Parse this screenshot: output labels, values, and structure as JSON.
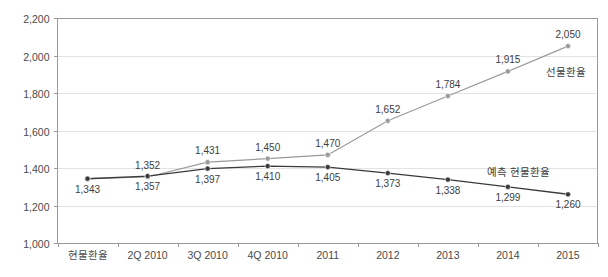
{
  "chart_data": {
    "type": "line",
    "title": "",
    "title_note": "title is cropped off the top edge of the screenshot and is not legible",
    "xlabel": "",
    "ylabel": "",
    "categories": [
      "현물환율",
      "2Q 2010",
      "3Q 2010",
      "4Q 2010",
      "2011",
      "2012",
      "2013",
      "2014",
      "2015"
    ],
    "ylim": [
      1000,
      2200
    ],
    "yticks": [
      1000,
      1200,
      1400,
      1600,
      1800,
      2000,
      2200
    ],
    "ytick_labels": [
      "1,000",
      "1,200",
      "1,400",
      "1,600",
      "1,800",
      "2,000",
      "2,200"
    ],
    "grid": true,
    "legend_position": "inline-end-of-line",
    "series": [
      {
        "name": "선물환율",
        "color": "#9a9a9a",
        "marker": "circle",
        "values": [
          1343,
          1352,
          1431,
          1450,
          1470,
          1652,
          1784,
          1915,
          2050
        ],
        "value_labels": [
          "1,343",
          "1,352",
          "1,431",
          "1,450",
          "1,470",
          "1,652",
          "1,784",
          "1,915",
          "2,050"
        ]
      },
      {
        "name": "예측 현물환율",
        "color": "#3a3a3a",
        "marker": "circle",
        "values": [
          1343,
          1357,
          1397,
          1410,
          1405,
          1373,
          1338,
          1299,
          1260
        ],
        "value_labels": [
          "1,343",
          "1,357",
          "1,397",
          "1,410",
          "1,405",
          "1,373",
          "1,338",
          "1,299",
          "1,260"
        ]
      }
    ],
    "annotations": [
      {
        "text": "선물환율",
        "series": "선물환율"
      },
      {
        "text": "예측 현물환율",
        "series": "예측 현물환율"
      }
    ]
  },
  "colors": {
    "forward_rate_line": "#9a9a9a",
    "spot_rate_line": "#3a3a3a",
    "gridline": "#e3e3e3",
    "axis": "#9a9a9a",
    "text": "#3a3a3a",
    "background": "#ffffff"
  }
}
